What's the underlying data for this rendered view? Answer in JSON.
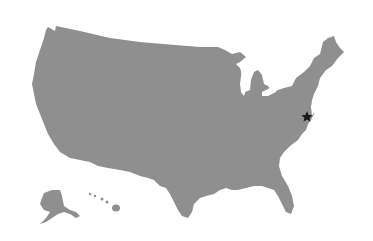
{
  "map": {
    "title": "United States",
    "land_color": "#8f8f8f",
    "background_color": "#ffffff",
    "regions": [
      "Contiguous United States",
      "Alaska",
      "Hawaii"
    ],
    "marker": {
      "icon": "star-icon",
      "glyph": "★",
      "color": "#1a1a1a",
      "location_label": "Washington, D.C. area",
      "x": 307,
      "y": 116
    }
  }
}
